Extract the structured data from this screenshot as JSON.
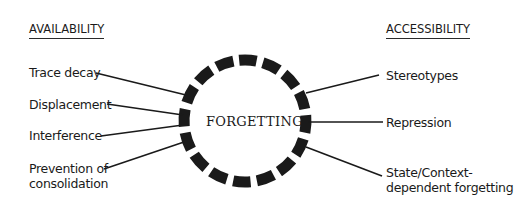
{
  "diagram": {
    "center": {
      "label": "FORGETTING",
      "dash_count": 16
    },
    "left": {
      "heading": "AVAILABILITY",
      "items": [
        {
          "label": "Trace decay"
        },
        {
          "label": "Displacement"
        },
        {
          "label": "Interference"
        },
        {
          "label_line1": "Prevention of",
          "label_line2": "consolidation"
        }
      ]
    },
    "right": {
      "heading": "ACCESSIBILITY",
      "items": [
        {
          "label": "Stereotypes"
        },
        {
          "label": "Repression"
        },
        {
          "label_line1": "State/Context-",
          "label_line2": "dependent forgetting"
        }
      ]
    },
    "colors": {
      "ink": "#1a1a1a",
      "background": "#ffffff"
    }
  }
}
